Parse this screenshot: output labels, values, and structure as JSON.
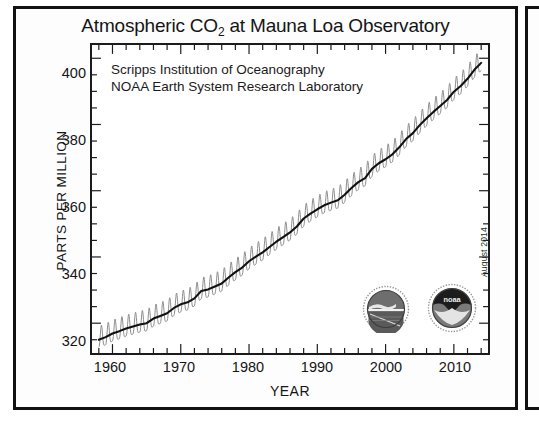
{
  "figure": {
    "title_main": "Atmospheric CO",
    "title_sub": "2",
    "title_rest": " at Mauna Loa Observatory",
    "title_full": "Atmospheric CO2 at Mauna Loa Observatory",
    "date_stamp": "August 2014",
    "annotation_line1": "Scripps Institution of Oceanography",
    "annotation_line2": "NOAA Earth System Research Laboratory",
    "logos": [
      {
        "name": "scripps-logo",
        "alt": "Scripps Institution of Oceanography seal"
      },
      {
        "name": "noaa-logo",
        "alt": "NOAA seal",
        "wordmark": "noaa"
      }
    ],
    "colors": {
      "frame": "#121212",
      "trend_line": "#111111",
      "seasonal_cycle": "#8c8c8c",
      "background": "#ffffff",
      "text": "#151515"
    }
  },
  "chart_data": {
    "type": "line",
    "title": "Atmospheric CO2 at Mauna Loa Observatory",
    "xlabel": "YEAR",
    "ylabel": "PARTS PER MILLION",
    "xlim": [
      1957,
      2015
    ],
    "ylim": [
      311,
      404
    ],
    "xticks": [
      1960,
      1970,
      1980,
      1990,
      2000,
      2010
    ],
    "yticks": [
      320,
      340,
      360,
      380,
      400
    ],
    "xtick_labels": [
      "1960",
      "1970",
      "1980",
      "1990",
      "2000",
      "2010"
    ],
    "ytick_labels": [
      "320",
      "340",
      "360",
      "380",
      "400"
    ],
    "grid": false,
    "legend": null,
    "minor_ticks": true,
    "annotations": [
      "Scripps Institution of Oceanography",
      "NOAA Earth System Research Laboratory",
      "August 2014"
    ],
    "series": [
      {
        "name": "Monthly mean CO2 (seasonal cycle)",
        "color": "#8c8c8c",
        "style": "sawtooth",
        "seasonal_amplitude_ppm": 3.2
      },
      {
        "name": "Seasonally corrected trend",
        "color": "#111111",
        "style": "solid",
        "x": [
          1958,
          1959,
          1960,
          1961,
          1962,
          1963,
          1964,
          1965,
          1966,
          1967,
          1968,
          1969,
          1970,
          1971,
          1972,
          1973,
          1974,
          1975,
          1976,
          1977,
          1978,
          1979,
          1980,
          1981,
          1982,
          1983,
          1984,
          1985,
          1986,
          1987,
          1988,
          1989,
          1990,
          1991,
          1992,
          1993,
          1994,
          1995,
          1996,
          1997,
          1998,
          1999,
          2000,
          2001,
          2002,
          2003,
          2004,
          2005,
          2006,
          2007,
          2008,
          2009,
          2010,
          2011,
          2012,
          2013,
          2014
        ],
        "values": [
          315.0,
          315.8,
          316.9,
          317.6,
          318.4,
          319.0,
          319.6,
          320.0,
          321.4,
          322.2,
          323.0,
          324.6,
          325.7,
          326.3,
          327.5,
          329.7,
          330.2,
          331.1,
          332.0,
          333.8,
          335.4,
          336.8,
          338.7,
          340.1,
          341.4,
          343.0,
          344.6,
          346.0,
          347.4,
          349.2,
          351.6,
          353.1,
          354.4,
          355.6,
          356.4,
          357.1,
          358.8,
          360.8,
          362.6,
          363.8,
          366.6,
          368.3,
          369.5,
          371.0,
          373.1,
          375.6,
          377.4,
          379.8,
          381.9,
          383.8,
          385.6,
          387.4,
          389.9,
          391.6,
          393.8,
          396.5,
          398.6
        ]
      }
    ]
  }
}
